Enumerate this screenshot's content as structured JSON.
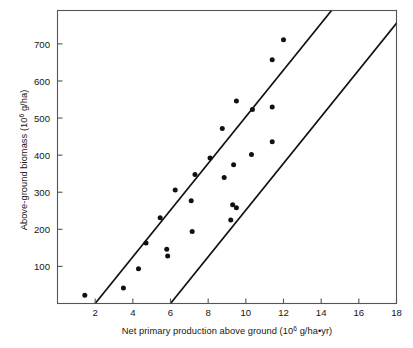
{
  "chart_data": {
    "type": "scatter",
    "title": "",
    "xlabel_parts": {
      "pre": "Net primary production above ground (10",
      "exp": "6",
      "post": " g/ha•yr)"
    },
    "ylabel_parts": {
      "pre": "Above-ground biomass (10",
      "exp": "6",
      "post": " g/ha)"
    },
    "xlabel": "Net primary production above ground (10⁶ g/ha•yr)",
    "ylabel": "Above-ground biomass (10⁶ g/ha)",
    "xlim": [
      0,
      18
    ],
    "ylim": [
      0,
      790
    ],
    "xticks": [
      2,
      4,
      6,
      8,
      10,
      12,
      14,
      16,
      18
    ],
    "xtick_labels": [
      "2",
      "4",
      "6",
      "8",
      "10",
      "12",
      "14",
      "16",
      "18"
    ],
    "yticks": [
      100,
      200,
      300,
      400,
      500,
      600,
      700
    ],
    "ytick_labels": [
      "100",
      "200",
      "300",
      "400",
      "500",
      "600",
      "700"
    ],
    "grid": false,
    "legend": "none",
    "marker_color": "#111111",
    "line_color": "#111111",
    "axis_color": "#555555",
    "background": "#ffffff",
    "points": [
      {
        "x": 1.45,
        "y": 22
      },
      {
        "x": 3.5,
        "y": 42
      },
      {
        "x": 4.3,
        "y": 94
      },
      {
        "x": 4.7,
        "y": 163
      },
      {
        "x": 5.45,
        "y": 231
      },
      {
        "x": 5.8,
        "y": 146
      },
      {
        "x": 5.85,
        "y": 128
      },
      {
        "x": 6.25,
        "y": 306
      },
      {
        "x": 7.1,
        "y": 277
      },
      {
        "x": 7.15,
        "y": 194
      },
      {
        "x": 7.3,
        "y": 348
      },
      {
        "x": 8.1,
        "y": 392
      },
      {
        "x": 8.75,
        "y": 472
      },
      {
        "x": 8.85,
        "y": 340
      },
      {
        "x": 9.2,
        "y": 225
      },
      {
        "x": 9.3,
        "y": 266
      },
      {
        "x": 9.35,
        "y": 374
      },
      {
        "x": 9.5,
        "y": 258
      },
      {
        "x": 9.5,
        "y": 546
      },
      {
        "x": 10.3,
        "y": 402
      },
      {
        "x": 10.35,
        "y": 523
      },
      {
        "x": 11.4,
        "y": 436
      },
      {
        "x": 11.4,
        "y": 530
      },
      {
        "x": 11.4,
        "y": 657
      },
      {
        "x": 12.0,
        "y": 711
      }
    ],
    "envelope_lines": [
      {
        "name": "upper-bound-line",
        "x1": 2.0,
        "y1": 0,
        "x2": 14.55,
        "y2": 790
      },
      {
        "name": "lower-bound-line",
        "x1": 6.0,
        "y1": 0,
        "x2": 18.55,
        "y2": 790
      }
    ]
  }
}
